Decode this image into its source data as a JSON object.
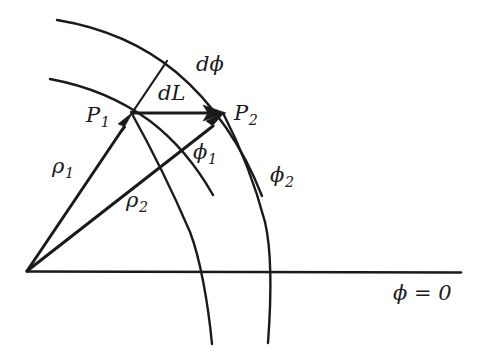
{
  "figure": {
    "kind": "geometry-diagram",
    "background_color": "#ffffff",
    "ink_color": "#1a1a1a"
  },
  "labels": {
    "point_1": {
      "base": "P",
      "sub": "1"
    },
    "point_2": {
      "base": "P",
      "sub": "2"
    },
    "arc_element": {
      "base": "dL",
      "sub": ""
    },
    "angle_element": {
      "base": "dϕ",
      "sub": ""
    },
    "radius_1": {
      "base": "ρ",
      "sub": "1"
    },
    "radius_2": {
      "base": "ρ",
      "sub": "2"
    },
    "angle_1": {
      "base": "ϕ",
      "sub": "1"
    },
    "angle_2": {
      "base": "ϕ",
      "sub": "2"
    },
    "reference_axis": {
      "base": "ϕ = 0",
      "sub": ""
    }
  },
  "geometry": {
    "origin": {
      "x": 27,
      "y": 271
    },
    "point_1": {
      "x": 132,
      "y": 113
    },
    "point_2": {
      "x": 224,
      "y": 114
    },
    "outer_arc_tick_top": {
      "x": 167,
      "y": 61
    },
    "axis_end": {
      "x": 461,
      "y": 272
    },
    "phi1_axis_crossing": {
      "x": 218,
      "y": 272
    },
    "phi2_axis_crossing": {
      "x": 277,
      "y": 272
    },
    "arc_rho1_start": {
      "x": 50,
      "y": 79
    },
    "arc_rho2_start": {
      "x": 57,
      "y": 20
    }
  },
  "elements": [
    {
      "name": "axis-phi-zero",
      "type": "line",
      "interactable": false
    },
    {
      "name": "arc-rho1",
      "type": "curve",
      "interactable": false
    },
    {
      "name": "arc-rho2",
      "type": "curve",
      "interactable": false
    },
    {
      "name": "radial-phi1",
      "type": "curve",
      "interactable": false
    },
    {
      "name": "radial-phi2",
      "type": "curve",
      "interactable": false
    },
    {
      "name": "vector-rho1",
      "type": "arrow",
      "interactable": false
    },
    {
      "name": "vector-rho2",
      "type": "arrow",
      "interactable": false
    },
    {
      "name": "vector-dL",
      "type": "arrow",
      "interactable": false
    },
    {
      "name": "tick-dphi",
      "type": "line",
      "interactable": false
    }
  ]
}
